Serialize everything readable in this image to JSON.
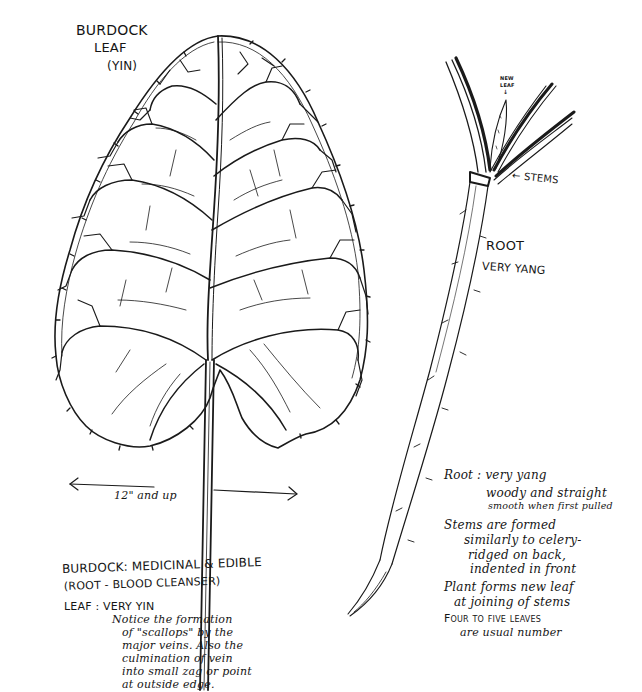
{
  "leaf_title": {
    "line1": "BURDOCK",
    "line2": "LEAF",
    "line3": "(YIN)"
  },
  "root_plant": {
    "new_leaf_label_1": "NEW",
    "new_leaf_label_2": "LEAF",
    "stems_label": "← STEMS",
    "root_label": "ROOT",
    "root_sub": "VERY YANG"
  },
  "measurement": {
    "label": "12\" and up"
  },
  "leaf_notes": {
    "heading_line1": "BURDOCK: MEDICINAL & EDIBLE",
    "heading_line2": "(ROOT - BLOOD CLEANSER)",
    "leaf_label": "LEAF : VERY YIN",
    "lines": [
      "Notice the formation",
      "of \"scallops\" by the",
      "major veins. Also the",
      "culmination of vein",
      "into small zag or point",
      "at outside edge."
    ]
  },
  "root_notes": {
    "root_line": "Root : very yang",
    "root_detail_1": "woody and straight",
    "root_detail_2": "smooth when first pulled",
    "stems_1": "Stems are formed",
    "stems_2": "similarly to celery-",
    "stems_3": "ridged on back,",
    "stems_4": "indented in front",
    "plant_1": "Plant forms new leaf",
    "plant_2": "at joining of stems",
    "leaves_1": "Four to five leaves",
    "leaves_2": "are usual number"
  }
}
